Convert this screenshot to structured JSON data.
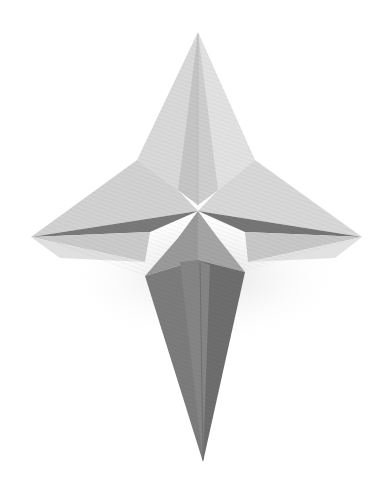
{
  "image": {
    "subject": "origami four-pointed star",
    "background": "#ffffff",
    "alt": "Grey paper origami four-pointed star with a long lower point"
  },
  "palette": {
    "lightest": "#e6e6e6",
    "light": "#d6d6d6",
    "mid_light": "#c4c4c4",
    "mid": "#a8a8a8",
    "mid_dark": "#8c8c8c",
    "dark": "#707070",
    "darkest": "#5e5e5e",
    "shadow": "#ededed"
  }
}
